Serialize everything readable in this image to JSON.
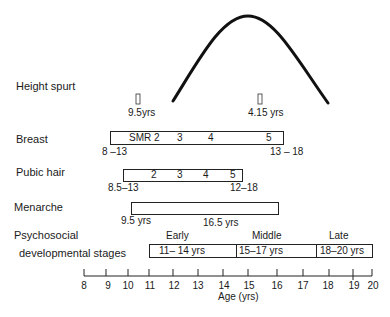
{
  "rows": {
    "height_spurt": {
      "label": "Height spurt",
      "marker_left_label": "9.5yrs",
      "marker_right_label": "4.15 yrs"
    },
    "breast": {
      "label": "Breast",
      "stages": [
        "SMR 2",
        "3",
        "4",
        "5"
      ],
      "start_range": "8 –13",
      "end_range": "13 – 18"
    },
    "pubic_hair": {
      "label": "Pubic hair",
      "stages": [
        "2",
        "3",
        "4",
        "5"
      ],
      "start_range": "8.5–13",
      "end_range": "12–18"
    },
    "menarche": {
      "label": "Menarche",
      "start_label": "9.5 yrs",
      "end_label": "16.5 yrs"
    },
    "psychosocial": {
      "label_line1": "Psychosocial",
      "label_line2": "developmental stages",
      "stages": [
        {
          "name": "Early",
          "range": "11– 14 yrs"
        },
        {
          "name": "Middle",
          "range": "15–17 yrs"
        },
        {
          "name": "Late",
          "range": "18–20 yrs"
        }
      ]
    }
  },
  "axis": {
    "title": "Age  (yrs)",
    "ticks": [
      "8",
      "9",
      "10",
      "11",
      "12",
      "13",
      "14",
      "15",
      "16",
      "17",
      "18",
      "19",
      "20"
    ]
  }
}
